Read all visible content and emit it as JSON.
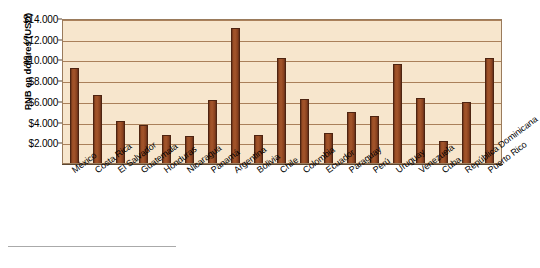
{
  "chart_data": {
    "type": "bar",
    "title": "",
    "subtitle": "",
    "xlabel": "",
    "ylabel": "PNB en dólares (USD)",
    "ylim": [
      0,
      14000
    ],
    "grid": true,
    "legend": "none",
    "tick_prefix": "$",
    "y_ticks": [
      {
        "value": 14000,
        "label": "$14.000"
      },
      {
        "value": 12000,
        "label": "$12.000"
      },
      {
        "value": 10000,
        "label": "$10.000"
      },
      {
        "value": 8000,
        "label": "$8.000"
      },
      {
        "value": 6000,
        "label": "$6.000"
      },
      {
        "value": 4000,
        "label": "$4.000"
      },
      {
        "value": 2000,
        "label": "$2.000"
      }
    ],
    "categories": [
      "México",
      "Costa Rica",
      "El Salvador",
      "Guatemala",
      "Honduras",
      "Nicaragua",
      "Panamá",
      "Argentina",
      "Bolivia",
      "Chile",
      "Colombia",
      "Ecuador",
      "Paraguay",
      "Perú",
      "Uruguay",
      "Venezuela",
      "Cuba",
      "República Dominicana",
      "Puerto Rico"
    ],
    "values": [
      9200,
      6600,
      4100,
      3700,
      2700,
      2600,
      6100,
      13000,
      2700,
      10100,
      6200,
      2900,
      4900,
      4500,
      9600,
      6300,
      2100,
      5900,
      10100
    ],
    "series": [
      {
        "name": "PNB en dólares (USD)",
        "values": [
          9200,
          6600,
          4100,
          3700,
          2700,
          2600,
          6100,
          13000,
          2700,
          10100,
          6200,
          2900,
          4900,
          4500,
          9600,
          6300,
          2100,
          5900,
          10100
        ]
      }
    ]
  },
  "style": {
    "plot_background": "#f7e6cd",
    "bar_color": "#9c4f26",
    "bar_edge_color": "#4e2411",
    "gridline_color": "#9c6d45",
    "axis_color": "#5c4630",
    "text_color": "#000000",
    "page_background": "#ffffff",
    "footer_rule_color": "#aaaaaa"
  }
}
